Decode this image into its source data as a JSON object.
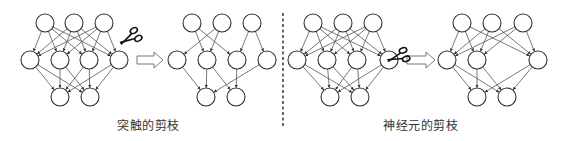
{
  "colors": {
    "node_stroke": "#333333",
    "edge": "#555555",
    "arrow": "#777777",
    "divider": "#444444",
    "text": "#333333"
  },
  "node_radius": 9,
  "captions": [
    {
      "text": "突触的剪枝",
      "x": 117,
      "y": 118
    },
    {
      "text": "神经元的剪枝",
      "x": 383,
      "y": 118
    }
  ],
  "divider": {
    "x": 283,
    "y1": 13,
    "y2": 128
  },
  "arrows": [
    {
      "x1": 137,
      "x2": 163,
      "y": 60
    },
    {
      "x1": 407,
      "x2": 435,
      "y": 60
    }
  ],
  "scissors": [
    {
      "x": 130,
      "y": 38,
      "angle": -30
    },
    {
      "x": 398,
      "y": 57,
      "angle": -20
    }
  ],
  "panels": [
    {
      "name": "synapse-before",
      "top": [
        [
          45,
          23
        ],
        [
          74,
          23
        ],
        [
          104,
          23
        ]
      ],
      "middle": [
        [
          30,
          60
        ],
        [
          60,
          60
        ],
        [
          89,
          60
        ],
        [
          119,
          60
        ]
      ],
      "bottom": [
        [
          60,
          97
        ],
        [
          90,
          97
        ]
      ],
      "edges_top_middle": [
        [
          0,
          0
        ],
        [
          0,
          1
        ],
        [
          0,
          2
        ],
        [
          0,
          3
        ],
        [
          1,
          0
        ],
        [
          1,
          1
        ],
        [
          1,
          2
        ],
        [
          1,
          3
        ],
        [
          2,
          0
        ],
        [
          2,
          1
        ],
        [
          2,
          2
        ],
        [
          2,
          3
        ]
      ],
      "edges_middle_bottom": [
        [
          0,
          0
        ],
        [
          0,
          1
        ],
        [
          1,
          0
        ],
        [
          1,
          1
        ],
        [
          2,
          0
        ],
        [
          2,
          1
        ],
        [
          3,
          0
        ],
        [
          3,
          1
        ]
      ]
    },
    {
      "name": "synapse-after",
      "top": [
        [
          192,
          23
        ],
        [
          222,
          23
        ],
        [
          252,
          23
        ]
      ],
      "middle": [
        [
          177,
          60
        ],
        [
          207,
          60
        ],
        [
          237,
          60
        ],
        [
          267,
          60
        ]
      ],
      "bottom": [
        [
          206,
          97
        ],
        [
          236,
          97
        ]
      ],
      "edges_top_middle": [
        [
          0,
          1
        ],
        [
          0,
          2
        ],
        [
          1,
          0
        ],
        [
          1,
          1
        ],
        [
          2,
          2
        ],
        [
          2,
          3
        ]
      ],
      "edges_middle_bottom": [
        [
          0,
          0
        ],
        [
          1,
          0
        ],
        [
          1,
          1
        ],
        [
          2,
          1
        ],
        [
          3,
          0
        ]
      ]
    },
    {
      "name": "neuron-before",
      "top": [
        [
          313,
          23
        ],
        [
          343,
          23
        ],
        [
          373,
          23
        ]
      ],
      "middle": [
        [
          297,
          60
        ],
        [
          327,
          60
        ],
        [
          357,
          60
        ],
        [
          389,
          60
        ]
      ],
      "bottom": [
        [
          330,
          97
        ],
        [
          360,
          97
        ]
      ],
      "edges_top_middle": [
        [
          0,
          0
        ],
        [
          0,
          1
        ],
        [
          0,
          2
        ],
        [
          0,
          3
        ],
        [
          1,
          0
        ],
        [
          1,
          1
        ],
        [
          1,
          2
        ],
        [
          1,
          3
        ],
        [
          2,
          0
        ],
        [
          2,
          1
        ],
        [
          2,
          2
        ],
        [
          2,
          3
        ]
      ],
      "edges_middle_bottom": [
        [
          0,
          0
        ],
        [
          0,
          1
        ],
        [
          1,
          0
        ],
        [
          1,
          1
        ],
        [
          2,
          0
        ],
        [
          2,
          1
        ],
        [
          3,
          0
        ],
        [
          3,
          1
        ]
      ]
    },
    {
      "name": "neuron-after",
      "top": [
        [
          462,
          23
        ],
        [
          492,
          23
        ],
        [
          523,
          23
        ]
      ],
      "middle": [
        [
          447,
          60
        ],
        [
          477,
          60
        ],
        [
          538,
          60
        ]
      ],
      "bottom": [
        [
          477,
          97
        ],
        [
          507,
          97
        ]
      ],
      "edges_top_middle": [
        [
          0,
          0
        ],
        [
          0,
          1
        ],
        [
          0,
          2
        ],
        [
          1,
          0
        ],
        [
          1,
          1
        ],
        [
          1,
          2
        ],
        [
          2,
          0
        ],
        [
          2,
          1
        ],
        [
          2,
          2
        ]
      ],
      "edges_middle_bottom": [
        [
          0,
          0
        ],
        [
          0,
          1
        ],
        [
          1,
          0
        ],
        [
          1,
          1
        ],
        [
          2,
          0
        ],
        [
          2,
          1
        ]
      ]
    }
  ]
}
